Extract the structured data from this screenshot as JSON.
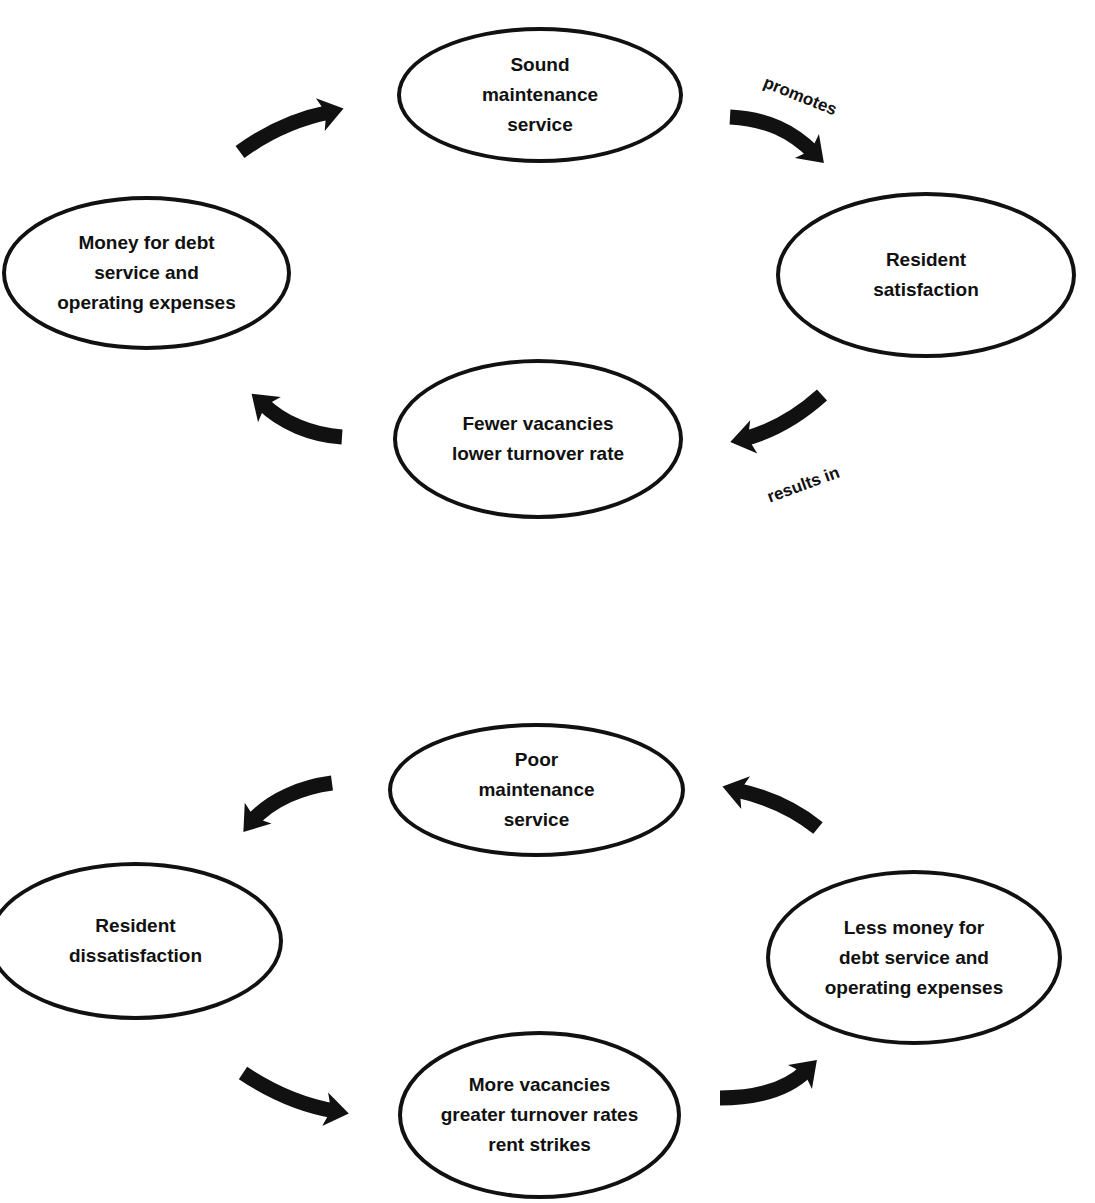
{
  "diagram": {
    "top_cycle": {
      "name": "positive-maintenance-cycle",
      "nodes": [
        {
          "id": "sound-maintenance",
          "text": "Sound\nmaintenance\nservice",
          "x": 397,
          "y": 27,
          "w": 286,
          "h": 136
        },
        {
          "id": "resident-satisfaction",
          "text": "Resident\nsatisfaction",
          "x": 776,
          "y": 192,
          "w": 300,
          "h": 166
        },
        {
          "id": "fewer-vacancies",
          "text": "Fewer vacancies\nlower turnover rate",
          "x": 393,
          "y": 359,
          "w": 290,
          "h": 160
        },
        {
          "id": "money-for-debt",
          "text": "Money for debt\nservice and\noperating expenses",
          "x": 2,
          "y": 196,
          "w": 289,
          "h": 154
        }
      ],
      "edge_labels": [
        {
          "id": "promotes-label",
          "text": "promotes",
          "x": 764,
          "y": 72,
          "rotate": 22
        },
        {
          "id": "results-in-label",
          "text": "results in",
          "x": 768,
          "y": 488,
          "rotate": -20
        }
      ],
      "arrows": [
        {
          "id": "arrow-money-to-sound",
          "direction": "up-right",
          "x": 230,
          "y": 90,
          "path": "M10 62 C 40 40, 70 28, 100 22",
          "head": [
            100,
            22
          ],
          "angle": -15
        },
        {
          "id": "arrow-sound-to-satisfaction",
          "direction": "down-right",
          "x": 722,
          "y": 105,
          "path": "M8 12 C 45 14, 70 26, 92 48",
          "head": [
            92,
            48
          ],
          "angle": 45
        },
        {
          "id": "arrow-satisfaction-to-fewer",
          "direction": "down-left",
          "x": 722,
          "y": 385,
          "path": "M100 10 C 80 28, 55 45, 22 54",
          "head": [
            22,
            54
          ],
          "angle": 168
        },
        {
          "id": "arrow-fewer-to-money",
          "direction": "up-left",
          "x": 242,
          "y": 385,
          "path": "M100 52 C 70 50, 40 38, 20 18",
          "head": [
            20,
            18
          ],
          "angle": 222
        }
      ]
    },
    "bottom_cycle": {
      "name": "negative-maintenance-cycle",
      "nodes": [
        {
          "id": "poor-maintenance",
          "text": "Poor\nmaintenance\nservice",
          "x": 388,
          "y": 723,
          "w": 297,
          "h": 134
        },
        {
          "id": "resident-dissatisfaction",
          "text": "Resident\ndissatisfaction",
          "x": -12,
          "y": 862,
          "w": 295,
          "h": 158
        },
        {
          "id": "more-vacancies",
          "text": "More vacancies\ngreater turnover rates\nrent strikes",
          "x": 398,
          "y": 1031,
          "w": 283,
          "h": 168
        },
        {
          "id": "less-money",
          "text": "Less money for\ndebt service and\noperating expenses",
          "x": 766,
          "y": 870,
          "w": 296,
          "h": 175
        }
      ],
      "edge_labels": [],
      "arrows": [
        {
          "id": "arrow-poor-to-dissatisfaction",
          "direction": "down-left",
          "x": 232,
          "y": 765,
          "path": "M100 18 C 70 22, 40 34, 20 56",
          "head": [
            20,
            56
          ],
          "angle": 128
        },
        {
          "id": "arrow-dissatisfaction-to-more",
          "direction": "down-right",
          "x": 235,
          "y": 1063,
          "path": "M8 10 C 35 28, 65 42, 100 48",
          "head": [
            100,
            48
          ],
          "angle": 10
        },
        {
          "id": "arrow-more-to-less",
          "direction": "up-right",
          "x": 712,
          "y": 1050,
          "path": "M8 48 C 45 48, 75 40, 95 20",
          "head": [
            95,
            20
          ],
          "angle": -45
        },
        {
          "id": "arrow-less-to-poor",
          "direction": "up-left",
          "x": 718,
          "y": 770,
          "path": "M100 58 C 80 42, 55 28, 18 20",
          "head": [
            18,
            20
          ],
          "angle": 195
        }
      ]
    },
    "colors": {
      "ink": "#111111",
      "background": "#ffffff"
    }
  }
}
